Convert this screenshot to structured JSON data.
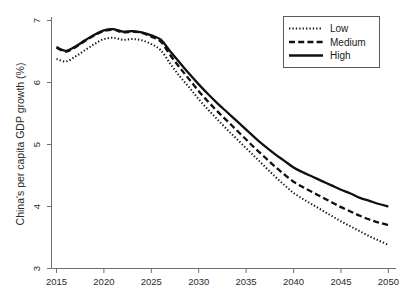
{
  "chart_data": {
    "type": "line",
    "title": "",
    "xlabel": "",
    "ylabel": "China's per capita GDP growth (%)",
    "xlim": [
      2015,
      2050
    ],
    "ylim": [
      3,
      7
    ],
    "grid": false,
    "legend_position": "top-right",
    "xticks": [
      "2015",
      "2020",
      "2025",
      "2030",
      "2035",
      "2040",
      "2045",
      "2050"
    ],
    "yticks": [
      "3",
      "4",
      "5",
      "6",
      "7"
    ],
    "x": [
      2015,
      2016,
      2017,
      2018,
      2019,
      2020,
      2021,
      2022,
      2023,
      2024,
      2025,
      2026,
      2027,
      2028,
      2029,
      2030,
      2031,
      2032,
      2033,
      2034,
      2035,
      2036,
      2037,
      2038,
      2039,
      2040,
      2041,
      2042,
      2043,
      2044,
      2045,
      2046,
      2047,
      2048,
      2049,
      2050
    ],
    "series": [
      {
        "name": "Low",
        "style": "dotted",
        "color": "#101010",
        "values": [
          6.38,
          6.34,
          6.42,
          6.52,
          6.62,
          6.7,
          6.72,
          6.69,
          6.7,
          6.68,
          6.62,
          6.52,
          6.3,
          6.1,
          5.92,
          5.73,
          5.56,
          5.4,
          5.24,
          5.09,
          4.94,
          4.79,
          4.64,
          4.49,
          4.35,
          4.22,
          4.12,
          4.03,
          3.94,
          3.85,
          3.76,
          3.68,
          3.6,
          3.52,
          3.45,
          3.38
        ]
      },
      {
        "name": "Medium",
        "style": "dashed",
        "color": "#101010",
        "values": [
          6.56,
          6.5,
          6.57,
          6.67,
          6.76,
          6.83,
          6.85,
          6.81,
          6.82,
          6.8,
          6.74,
          6.66,
          6.44,
          6.24,
          6.05,
          5.86,
          5.69,
          5.53,
          5.38,
          5.23,
          5.08,
          4.93,
          4.79,
          4.65,
          4.52,
          4.4,
          4.31,
          4.23,
          4.15,
          4.07,
          3.99,
          3.92,
          3.85,
          3.79,
          3.74,
          3.7
        ]
      },
      {
        "name": "High",
        "style": "solid",
        "color": "#101010",
        "values": [
          6.57,
          6.51,
          6.58,
          6.68,
          6.77,
          6.84,
          6.86,
          6.82,
          6.83,
          6.81,
          6.76,
          6.69,
          6.5,
          6.32,
          6.14,
          5.97,
          5.81,
          5.66,
          5.52,
          5.38,
          5.24,
          5.1,
          4.97,
          4.85,
          4.74,
          4.63,
          4.55,
          4.48,
          4.41,
          4.34,
          4.27,
          4.21,
          4.14,
          4.09,
          4.04,
          4.0
        ]
      }
    ]
  },
  "legend": {
    "items": [
      {
        "label": "Low"
      },
      {
        "label": "Medium"
      },
      {
        "label": "High"
      }
    ]
  }
}
